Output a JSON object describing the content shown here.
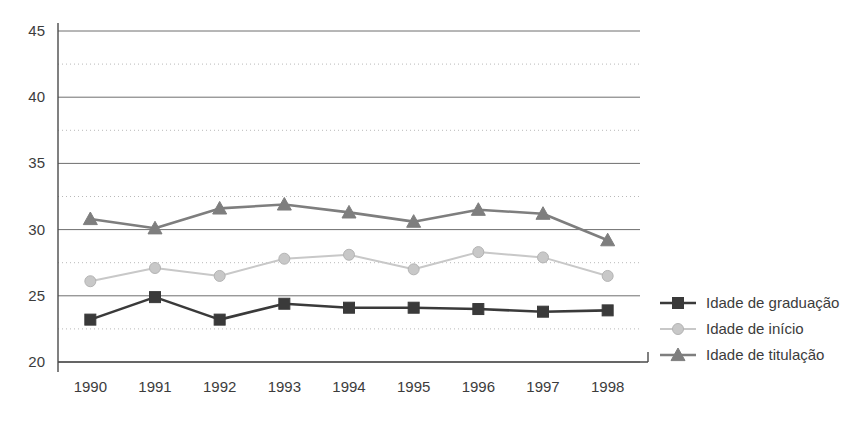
{
  "chart_data": {
    "type": "line",
    "title": "",
    "subtitle": "",
    "xlabel": "",
    "ylabel": "",
    "categories": [
      "1990",
      "1991",
      "1992",
      "1993",
      "1994",
      "1995",
      "1996",
      "1997",
      "1998"
    ],
    "ylim": [
      20,
      45
    ],
    "y_major_ticks": [
      20,
      25,
      30,
      35,
      40,
      45
    ],
    "y_minor_ticks": [
      22.5,
      27.5,
      32.5,
      37.5,
      42.5
    ],
    "y_tick_labels": [
      "20",
      "25",
      "30",
      "35",
      "40",
      "45"
    ],
    "grid": "major-solid-minor-dotted",
    "legend_position": "right",
    "series": [
      {
        "name": "Idade de graduação",
        "marker": "square",
        "color": "#3a3a3a",
        "values": [
          23.2,
          24.9,
          23.2,
          24.4,
          24.1,
          24.1,
          24.0,
          23.8,
          23.9
        ]
      },
      {
        "name": "Idade de início",
        "marker": "circle",
        "color": "#c8c8c8",
        "values": [
          26.1,
          27.1,
          26.5,
          27.8,
          28.1,
          27.0,
          28.3,
          27.9,
          26.5
        ]
      },
      {
        "name": "Idade de titulação",
        "marker": "triangle",
        "color": "#7e7e7e",
        "values": [
          30.8,
          30.1,
          31.6,
          31.9,
          31.3,
          30.6,
          31.5,
          31.2,
          29.2
        ]
      }
    ]
  },
  "legend": {
    "items": [
      {
        "label": "Idade de graduação",
        "marker": "square",
        "color": "#3a3a3a"
      },
      {
        "label": "Idade de início",
        "marker": "circle",
        "color": "#c8c8c8"
      },
      {
        "label": "Idade de titulação",
        "marker": "triangle",
        "color": "#7e7e7e"
      }
    ]
  },
  "colors": {
    "background": "#ffffff",
    "axis": "#4a4a4a",
    "grid_major": "#6e6e6e",
    "grid_minor": "#b9b9b9",
    "text": "#3c3c3c"
  }
}
